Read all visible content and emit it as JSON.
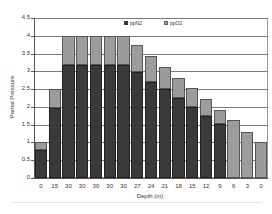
{
  "chart_data": {
    "type": "bar",
    "stacked": true,
    "title": "",
    "xlabel": "Depth (m)",
    "ylabel": "Partial Pressure",
    "ylim": [
      0,
      4.5
    ],
    "yticks": [
      "0",
      "0.5",
      "1",
      "1.5",
      "2",
      "2.5",
      "3",
      "3.5",
      "4",
      "4.5"
    ],
    "grid": true,
    "legend_position": "top-inside",
    "categories": [
      "0",
      "15",
      "30",
      "30",
      "30",
      "30",
      "30",
      "27",
      "24",
      "21",
      "18",
      "15",
      "12",
      "9",
      "6",
      "3",
      "0"
    ],
    "series": [
      {
        "name": "ppN2",
        "color": "#3a3a3a",
        "values": [
          0.79,
          1.97,
          3.18,
          3.18,
          3.18,
          3.18,
          3.18,
          2.97,
          2.71,
          2.49,
          2.25,
          2.0,
          1.75,
          1.52,
          0,
          0,
          0
        ]
      },
      {
        "name": "ppO2",
        "color": "#9c9c9c",
        "values": [
          0.21,
          0.53,
          0.82,
          0.82,
          0.82,
          0.82,
          0.82,
          0.78,
          0.72,
          0.64,
          0.57,
          0.52,
          0.47,
          0.4,
          1.63,
          1.3,
          1.01
        ]
      }
    ]
  },
  "labels": {
    "xlabel": "Depth (m)",
    "ylabel": "Partial Pressure",
    "legend": [
      "ppN2",
      "ppO2"
    ]
  }
}
